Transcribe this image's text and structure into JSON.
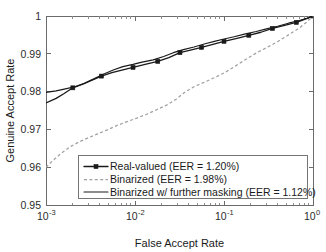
{
  "chart_data": {
    "type": "line",
    "title": "",
    "xlabel": "False Accept Rate",
    "ylabel": "Genuine Accept Rate",
    "xscale": "log",
    "yscale": "linear",
    "xlim": [
      0.001,
      1
    ],
    "ylim": [
      0.95,
      1
    ],
    "grid": false,
    "legend_position": "lower right",
    "xtick_labels": [
      "10-3",
      "10-2",
      "10-1",
      "100"
    ],
    "xtick_bases": [
      "10",
      "10",
      "10",
      "10"
    ],
    "xtick_exponents": [
      "-3",
      "-2",
      "-1",
      "0"
    ],
    "xtick_values": [
      0.001,
      0.01,
      0.1,
      1
    ],
    "ytick_labels": [
      "0.95",
      "0.96",
      "0.97",
      "0.98",
      "0.99",
      "1"
    ],
    "ytick_values": [
      0.95,
      0.96,
      0.97,
      0.98,
      0.99,
      1.0
    ],
    "series": [
      {
        "name": "Real-valued (EER = 1.20%)",
        "style": "solid-with-square-markers",
        "color": "#1a1a1a",
        "marker": "square",
        "x": [
          0.001,
          0.0013,
          0.0016,
          0.002,
          0.0026,
          0.0032,
          0.0042,
          0.0055,
          0.0075,
          0.0095,
          0.013,
          0.018,
          0.024,
          0.032,
          0.042,
          0.056,
          0.075,
          0.1,
          0.14,
          0.19,
          0.26,
          0.35,
          0.48,
          0.65,
          0.85,
          1.0
        ],
        "y": [
          0.977,
          0.9782,
          0.9795,
          0.981,
          0.982,
          0.9829,
          0.9841,
          0.985,
          0.9858,
          0.9864,
          0.9872,
          0.988,
          0.989,
          0.9903,
          0.991,
          0.9917,
          0.9925,
          0.9933,
          0.9941,
          0.9949,
          0.9957,
          0.9967,
          0.9975,
          0.9983,
          0.9993,
          1.0
        ],
        "marker_x": [
          0.002,
          0.0042,
          0.0095,
          0.018,
          0.032,
          0.056,
          0.1,
          0.19,
          0.35,
          0.65,
          1.0
        ],
        "marker_y": [
          0.981,
          0.9841,
          0.9864,
          0.988,
          0.9903,
          0.9917,
          0.9933,
          0.9949,
          0.9967,
          0.9983,
          1.0
        ]
      },
      {
        "name": "Binarized (EER = 1.98%)",
        "style": "dashed",
        "color": "#a0a0a0",
        "marker": "none",
        "x": [
          0.001,
          0.0012,
          0.0015,
          0.0019,
          0.0024,
          0.003,
          0.0038,
          0.0048,
          0.0062,
          0.008,
          0.0105,
          0.0135,
          0.0175,
          0.023,
          0.029,
          0.037,
          0.048,
          0.062,
          0.08,
          0.105,
          0.135,
          0.175,
          0.23,
          0.3,
          0.4,
          0.53,
          0.7,
          0.85,
          1.0
        ],
        "y": [
          0.96,
          0.9618,
          0.9638,
          0.9655,
          0.9668,
          0.9678,
          0.9688,
          0.9698,
          0.971,
          0.972,
          0.973,
          0.974,
          0.9752,
          0.9765,
          0.978,
          0.98,
          0.9815,
          0.9826,
          0.9838,
          0.9852,
          0.9868,
          0.9885,
          0.9902,
          0.9916,
          0.9932,
          0.995,
          0.9968,
          0.9984,
          1.0
        ]
      },
      {
        "name": "Binarized w/ further masking (EER = 1.12%)",
        "style": "solid",
        "color": "#1a1a1a",
        "marker": "none",
        "x": [
          0.001,
          0.0013,
          0.0017,
          0.0021,
          0.0027,
          0.0034,
          0.0044,
          0.0057,
          0.0073,
          0.0095,
          0.012,
          0.016,
          0.021,
          0.027,
          0.035,
          0.046,
          0.06,
          0.078,
          0.1,
          0.13,
          0.17,
          0.23,
          0.3,
          0.4,
          0.53,
          0.7,
          0.85,
          1.0
        ],
        "y": [
          0.9798,
          0.9802,
          0.9808,
          0.9813,
          0.9822,
          0.9833,
          0.9846,
          0.9857,
          0.9866,
          0.9872,
          0.9878,
          0.9884,
          0.9893,
          0.9903,
          0.9911,
          0.9918,
          0.9926,
          0.9933,
          0.9939,
          0.9945,
          0.9952,
          0.9959,
          0.9966,
          0.9973,
          0.9981,
          0.9988,
          0.9994,
          1.0
        ]
      }
    ]
  },
  "legend": {
    "entries": [
      {
        "label": "Real-valued (EER = 1.20%)",
        "style": "solid-with-square-markers"
      },
      {
        "label": "Binarized (EER = 1.98%)",
        "style": "dashed"
      },
      {
        "label": "Binarized w/ further masking (EER = 1.12%)",
        "style": "solid"
      }
    ]
  }
}
